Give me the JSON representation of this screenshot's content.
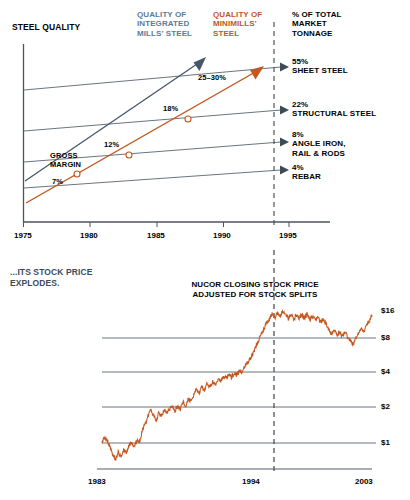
{
  "meta": {
    "width": 410,
    "height": 500,
    "colors": {
      "blue": "#5b7c99",
      "orange": "#c4561e",
      "line_gray": "#6b7680",
      "dark_text": "#3d4b57",
      "black": "#000000"
    }
  },
  "top_chart": {
    "title": "STEEL QUALITY",
    "legend": [
      {
        "id": "integrated",
        "label": "QUALITY OF\nINTEGRATED\nMILLS' STEEL",
        "line1": "QUALITY OF",
        "line2": "INTEGRATED",
        "line3": "MILLS' STEEL",
        "color": "#5b7c99"
      },
      {
        "id": "minimills",
        "label": "QUALITY OF\nMINIMILLS'\nSTEEL",
        "line1": "QUALITY OF",
        "line2": "MINIMILLS'",
        "line3": "STEEL",
        "color": "#c4561e"
      }
    ],
    "right_header": {
      "line1": "% OF TOTAL",
      "line2": "MARKET",
      "line3": "TONNAGE"
    },
    "segments": [
      {
        "pct": "55%",
        "name": "SHEET STEEL",
        "name2": ""
      },
      {
        "pct": "22%",
        "name": "STRUCTURAL STEEL",
        "name2": ""
      },
      {
        "pct": "8%",
        "name": "ANGLE IRON,",
        "name2": "RAIL & RODS"
      },
      {
        "pct": "4%",
        "name": "REBAR",
        "name2": ""
      }
    ],
    "gross_margin_label_1": "GROSS",
    "gross_margin_label_2": "MARGIN",
    "margin_points": [
      {
        "value": "7%",
        "year": 1979
      },
      {
        "value": "12%",
        "year": 1983
      },
      {
        "value": "18%",
        "year": 1987
      },
      {
        "value": "25–30%",
        "year": 1992
      }
    ],
    "x_ticks": [
      "1975",
      "1980",
      "1985",
      "1990",
      "1995"
    ]
  },
  "bottom_chart": {
    "caption_line1": "...ITS STOCK PRICE",
    "caption_line2": "EXPLODES.",
    "series_title_line1": "NUCOR CLOSING STOCK PRICE",
    "series_title_line2": "ADJUSTED FOR STOCK SPLITS",
    "y_ticks": [
      "$16",
      "$8",
      "$4",
      "$2",
      "$1"
    ],
    "x_ticks": [
      "1983",
      "1994",
      "2003"
    ]
  },
  "chart_data": [
    {
      "type": "line",
      "id": "steel-quality",
      "title": "STEEL QUALITY",
      "xlabel": "",
      "ylabel": "STEEL QUALITY",
      "xlim": [
        1975,
        1996
      ],
      "grid": false,
      "legend_position": "top",
      "annotations": [
        "GROSS MARGIN",
        "7%",
        "12%",
        "18%",
        "25–30%"
      ],
      "xticklabels": [
        "1975",
        "1980",
        "1985",
        "1990",
        "1995"
      ],
      "series": [
        {
          "name": "QUALITY OF INTEGRATED MILLS' STEEL",
          "color": "#46566b",
          "x": [
            1975,
            1987.5
          ],
          "values": [
            18,
            84
          ]
        },
        {
          "name": "QUALITY OF MINIMILLS' STEEL",
          "color": "#c4561e",
          "x": [
            1975,
            1993
          ],
          "values": [
            4,
            78
          ]
        },
        {
          "name": "REBAR band (4% of tonnage)",
          "color": "#6b7680",
          "x": [
            1975,
            1994
          ],
          "values": [
            13,
            27
          ]
        },
        {
          "name": "ANGLE IRON, RAIL & RODS band (8% of tonnage)",
          "color": "#6b7680",
          "x": [
            1975,
            1994
          ],
          "values": [
            26,
            43
          ]
        },
        {
          "name": "STRUCTURAL STEEL band (22% of tonnage)",
          "color": "#6b7680",
          "x": [
            1975,
            1994
          ],
          "values": [
            44,
            61
          ]
        },
        {
          "name": "SHEET STEEL band (55% of tonnage)",
          "color": "#6b7680",
          "x": [
            1975,
            1994
          ],
          "values": [
            62,
            80
          ]
        }
      ],
      "markers": [
        {
          "label": "7%",
          "x": 1979,
          "y": 20
        },
        {
          "label": "12%",
          "x": 1983,
          "y": 39
        },
        {
          "label": "18%",
          "x": 1987.3,
          "y": 58
        },
        {
          "label": "25–30%",
          "x": 1992,
          "y": 75
        }
      ],
      "market_tonnage": [
        {
          "pct": 55,
          "label": "SHEET STEEL"
        },
        {
          "pct": 22,
          "label": "STRUCTURAL STEEL"
        },
        {
          "pct": 8,
          "label": "ANGLE IRON, RAIL & RODS"
        },
        {
          "pct": 4,
          "label": "REBAR"
        }
      ]
    },
    {
      "type": "line",
      "id": "nucor-stock-price",
      "title": "NUCOR CLOSING STOCK PRICE ADJUSTED FOR STOCK SPLITS",
      "xlabel": "",
      "ylabel": "Price (USD, log scale)",
      "xlim": [
        1983,
        2003
      ],
      "ylim": [
        0.5,
        22
      ],
      "yscale": "log2",
      "yticklabels": [
        "$1",
        "$2",
        "$4",
        "$8",
        "$16"
      ],
      "yticks": [
        1,
        2,
        4,
        8,
        16
      ],
      "xticklabels": [
        "1983",
        "1994",
        "2003"
      ],
      "grid": true,
      "marker_line": {
        "label": "1994",
        "x": 1994.5,
        "style": "dashed"
      },
      "color": "#c4561e",
      "x": [
        1983.0,
        1983.2,
        1983.4,
        1983.6,
        1983.8,
        1984.0,
        1984.2,
        1984.4,
        1984.6,
        1984.8,
        1985.0,
        1985.2,
        1985.4,
        1985.6,
        1985.8,
        1986.0,
        1986.2,
        1986.4,
        1986.6,
        1986.8,
        1987.0,
        1987.2,
        1987.4,
        1987.6,
        1987.8,
        1988.0,
        1988.2,
        1988.4,
        1988.6,
        1988.8,
        1989.0,
        1989.2,
        1989.4,
        1989.6,
        1989.8,
        1990.0,
        1990.2,
        1990.4,
        1990.6,
        1990.8,
        1991.0,
        1991.2,
        1991.4,
        1991.6,
        1991.8,
        1992.0,
        1992.2,
        1992.4,
        1992.6,
        1992.8,
        1993.0,
        1993.2,
        1993.4,
        1993.6,
        1993.8,
        1994.0,
        1994.2,
        1994.4,
        1994.6,
        1994.8,
        1995.0,
        1995.2,
        1995.4,
        1995.6,
        1995.8,
        1996.0,
        1996.2,
        1996.4,
        1996.6,
        1996.8,
        1997.0,
        1997.2,
        1997.4,
        1997.6,
        1997.8,
        1998.0,
        1998.2,
        1998.4,
        1998.6,
        1998.8,
        1999.0,
        1999.2,
        1999.4,
        1999.6,
        1999.8,
        2000.0,
        2000.2,
        2000.4,
        2000.6,
        2000.8,
        2001.0,
        2001.2,
        2001.4,
        2001.6,
        2001.8,
        2002.0,
        2002.2,
        2002.4,
        2002.6,
        2002.8,
        2003.0
      ],
      "values": [
        1.0,
        1.12,
        1.05,
        0.93,
        0.8,
        0.72,
        0.83,
        0.74,
        0.88,
        0.8,
        0.95,
        1.0,
        0.92,
        1.05,
        1.02,
        1.3,
        1.45,
        1.7,
        1.95,
        1.75,
        1.55,
        1.8,
        1.7,
        1.9,
        1.8,
        1.95,
        2.1,
        1.9,
        2.05,
        1.95,
        2.25,
        2.1,
        2.4,
        2.3,
        2.6,
        2.9,
        2.7,
        3.0,
        2.85,
        3.25,
        3.0,
        3.4,
        3.2,
        3.55,
        3.35,
        3.7,
        3.6,
        3.9,
        3.7,
        4.0,
        3.9,
        4.2,
        4.1,
        4.6,
        5.0,
        5.4,
        6.0,
        6.7,
        7.6,
        8.6,
        9.5,
        10.8,
        11.6,
        12.8,
        11.9,
        13.4,
        12.5,
        13.6,
        12.6,
        11.8,
        12.6,
        11.7,
        12.6,
        11.8,
        12.6,
        11.9,
        12.8,
        11.6,
        12.2,
        11.4,
        12.1,
        10.9,
        11.7,
        10.5,
        9.4,
        8.6,
        9.3,
        8.4,
        9.1,
        8.3,
        9.0,
        8.1,
        7.6,
        7.1,
        8.0,
        8.8,
        9.7,
        9.0,
        10.4,
        11.2,
        12.6
      ]
    }
  ]
}
